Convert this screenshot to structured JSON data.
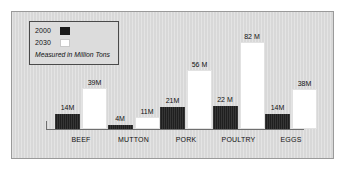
{
  "legend": {
    "entries": [
      {
        "label": "2000",
        "swatch": "dark-swatch-icon",
        "color": "#1f1f1f"
      },
      {
        "label": "2030",
        "swatch": "light-swatch-icon",
        "color": "#ffffff"
      }
    ],
    "note": "Measured in Million Tons"
  },
  "colors": {
    "background": "#d8d8d8",
    "page": "#ffffff",
    "border": "#9a9a9a",
    "axis": "#6f6f6f",
    "series_2000": "#1f1f1f",
    "series_2030": "#ffffff",
    "text": "#111111"
  },
  "chart_data": {
    "type": "bar",
    "title": "",
    "subtitle": "",
    "xlabel": "",
    "ylabel": "",
    "unit": "Million Tons",
    "grid": false,
    "legend_position": "top-left",
    "ylim": [
      0,
      90
    ],
    "categories": [
      "BEEF",
      "MUTTON",
      "PORK",
      "POULTRY",
      "EGGS"
    ],
    "series": [
      {
        "name": "2000",
        "color": "#1f1f1f",
        "values": [
          14,
          4,
          21,
          22,
          14
        ],
        "labels": [
          "14M",
          "4M",
          "21M",
          "22 M",
          "14M"
        ]
      },
      {
        "name": "2030",
        "color": "#ffffff",
        "values": [
          39,
          11,
          56,
          82,
          38
        ],
        "labels": [
          "39M",
          "11M",
          "56 M",
          "82 M",
          "38M"
        ]
      }
    ]
  }
}
